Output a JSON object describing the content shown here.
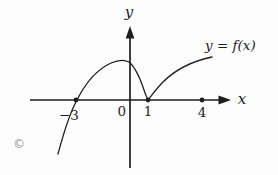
{
  "figure": {
    "type": "function-graph-sketch",
    "colors": {
      "ink": "#1d1d1d",
      "background": "#fdfdfd",
      "copyright_gray": "#8f8f8f"
    },
    "axis_labels": {
      "x": "x",
      "y": "y"
    },
    "curve_label": "y = f(x)",
    "tick_labels": {
      "minus_three": "−3",
      "zero": "0",
      "one": "1",
      "four": "4"
    },
    "marked_points_x": [
      -3,
      1,
      4
    ],
    "curve_features": {
      "x_intercepts": [
        -3,
        1
      ],
      "touches_axis_at": 1,
      "dot_on_axis_at": 4
    },
    "copyright_mark": "©"
  }
}
